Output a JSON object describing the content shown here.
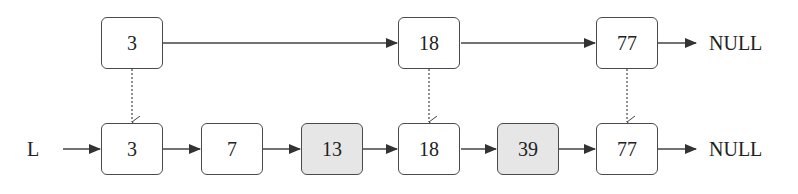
{
  "diagram": {
    "type": "skip-list",
    "list_label": "L",
    "null_label": "NULL",
    "levels": [
      {
        "name": "upper-level",
        "nodes": [
          {
            "value": "3",
            "shaded": false
          },
          {
            "value": "18",
            "shaded": false
          },
          {
            "value": "77",
            "shaded": false
          }
        ],
        "terminator": "NULL"
      },
      {
        "name": "base-level",
        "nodes": [
          {
            "value": "3",
            "shaded": false
          },
          {
            "value": "7",
            "shaded": false
          },
          {
            "value": "13",
            "shaded": true
          },
          {
            "value": "18",
            "shaded": false
          },
          {
            "value": "39",
            "shaded": true
          },
          {
            "value": "77",
            "shaded": false
          }
        ],
        "terminator": "NULL"
      }
    ],
    "down_links": [
      {
        "from": "upper-level:3",
        "to": "base-level:3",
        "style": "dotted"
      },
      {
        "from": "upper-level:18",
        "to": "base-level:18",
        "style": "dotted"
      },
      {
        "from": "upper-level:77",
        "to": "base-level:77",
        "style": "dotted"
      }
    ],
    "colors": {
      "border": "#4a4a4a",
      "shaded_fill": "#e6e6e6",
      "arrow": "#333333"
    }
  }
}
